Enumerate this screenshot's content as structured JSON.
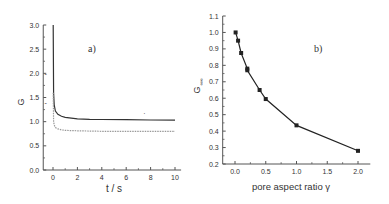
{
  "chart_data": [
    {
      "type": "line",
      "panel_label": "a)",
      "xlabel": "t / s",
      "ylabel": "G",
      "xlim": [
        -0.8,
        10.5
      ],
      "ylim": [
        0,
        3.0
      ],
      "xticks": [
        0,
        2,
        4,
        6,
        8,
        10
      ],
      "yticks": [
        0.0,
        0.5,
        1.0,
        1.5,
        2.0,
        2.5,
        3.0
      ],
      "xtick_labels": [
        "0",
        "2",
        "4",
        "6",
        "8",
        "10"
      ],
      "ytick_labels": [
        "0.0",
        "0.5",
        "1.0",
        "1.5",
        "2.0",
        "2.5",
        "3.0"
      ],
      "grid": false,
      "series": [
        {
          "name": "upper curve",
          "style": "solid",
          "color": "#333333",
          "x": [
            0.02,
            0.05,
            0.1,
            0.2,
            0.4,
            0.7,
            1.0,
            2,
            3,
            4,
            6,
            8,
            10
          ],
          "y": [
            3.0,
            1.6,
            1.35,
            1.22,
            1.15,
            1.11,
            1.09,
            1.06,
            1.05,
            1.045,
            1.04,
            1.035,
            1.03
          ]
        },
        {
          "name": "lower curve",
          "style": "dotted",
          "color": "#999999",
          "x": [
            0.02,
            0.05,
            0.1,
            0.2,
            0.4,
            0.7,
            1.0,
            2,
            4,
            6,
            8,
            10
          ],
          "y": [
            1.6,
            1.0,
            0.93,
            0.88,
            0.85,
            0.83,
            0.82,
            0.81,
            0.8,
            0.8,
            0.8,
            0.8
          ]
        }
      ],
      "annotations": [
        {
          "x": -0.6,
          "y": 1.98,
          "text": "-"
        },
        {
          "x": -0.6,
          "y": 1.38,
          "text": "-"
        },
        {
          "x": 7.5,
          "y": 1.15,
          "text": "·"
        }
      ]
    },
    {
      "type": "line",
      "panel_label": "b)",
      "xlabel": "pore aspect ratio γ",
      "ylabel": "G∞",
      "xlim": [
        -0.2,
        2.2
      ],
      "ylim": [
        0.2,
        1.1
      ],
      "xticks": [
        0.0,
        0.5,
        1.0,
        1.5,
        2.0
      ],
      "yticks": [
        0.2,
        0.3,
        0.4,
        0.5,
        0.6,
        0.7,
        0.8,
        0.9,
        1.0,
        1.1
      ],
      "xtick_labels": [
        "0.0",
        "0.5",
        "1.0",
        "1.5",
        "2.0"
      ],
      "ytick_labels": [
        "0.2",
        "0.3",
        "0.4",
        "0.5",
        "0.6",
        "0.7",
        "0.8",
        "0.9",
        "1.0",
        "1.1"
      ],
      "grid": false,
      "series": [
        {
          "name": "G∞ vs γ",
          "marker": "square",
          "color": "#222222",
          "x": [
            0.01,
            0.05,
            0.1,
            0.2,
            0.2,
            0.4,
            0.5,
            1.0,
            2.0
          ],
          "y": [
            1.0,
            0.95,
            0.875,
            0.78,
            0.77,
            0.65,
            0.595,
            0.435,
            0.28
          ]
        }
      ]
    }
  ]
}
